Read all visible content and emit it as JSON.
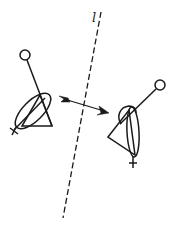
{
  "diagram": {
    "type": "reflection-illustration",
    "mirror_line": {
      "label": "l",
      "style": "dashed",
      "from": [
        101,
        12
      ],
      "to": [
        63,
        218
      ]
    },
    "arrow": {
      "direction": "left-to-right",
      "from": [
        60,
        98
      ],
      "to": [
        108,
        112
      ]
    },
    "figures": [
      {
        "name": "original",
        "position": "left",
        "symbol": "stick figure with circle head, ellipse, triangle, cross foot"
      },
      {
        "name": "reflected-image",
        "position": "right",
        "symbol": "mirrored stick figure with circle head, ellipse, triangle, cross foot"
      }
    ],
    "colors": {
      "stroke": "#1a1a1a",
      "background": "#ffffff"
    }
  }
}
